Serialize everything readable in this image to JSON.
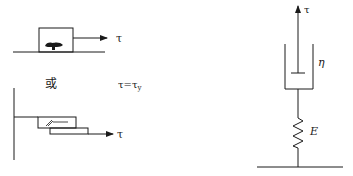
{
  "left_top": {
    "description": "Block resting on ground plane with applied stress",
    "stress_label": "τ"
  },
  "middle_labels": {
    "or_label": "或",
    "condition_label": "τ=τ",
    "condition_subscript": "y"
  },
  "left_bottom": {
    "description": "Two sliding plates attached to wall (friction element)",
    "stress_label": "τ"
  },
  "right": {
    "description": "Maxwell-type model: dashpot in series with spring fixed to ground",
    "stress_label": "τ",
    "dashpot_label": "η",
    "spring_label": "E"
  },
  "colors": {
    "stroke": "#1a1a1a",
    "background": "#ffffff"
  }
}
